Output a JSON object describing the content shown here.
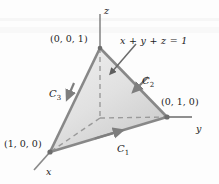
{
  "figure": {
    "type": "3d-diagram",
    "background_color": "#fdfdfd",
    "fill_colors": [
      "#e9e9e9",
      "#cfcfcf"
    ],
    "edge_color": "#8d8d8d",
    "axis_color": "#7d7d7d",
    "text_color": "#1c1c1c"
  },
  "axes": [
    {
      "name": "z",
      "label": "z",
      "label_x": 104,
      "label_y": 6
    },
    {
      "name": "y",
      "label": "y",
      "label_x": 196,
      "label_y": 124
    },
    {
      "name": "x",
      "label": "x",
      "label_x": 46,
      "label_y": 167
    }
  ],
  "vertices": [
    {
      "name": "z-intercept",
      "label": "(0, 0, 1)",
      "label_x": 50,
      "label_y": 34,
      "point_x": 100,
      "point_y": 48
    },
    {
      "name": "y-intercept",
      "label": "(0, 1, 0)",
      "label_x": 161,
      "label_y": 97,
      "point_x": 167,
      "point_y": 117
    },
    {
      "name": "x-intercept",
      "label": "(1, 0, 0)",
      "label_x": 4,
      "label_y": 139,
      "point_x": 50,
      "point_y": 152
    }
  ],
  "origin": {
    "x": 100,
    "y": 118
  },
  "plane": {
    "equation": "x + y + z = 1",
    "label_x": 120,
    "label_y": 36
  },
  "curves": [
    {
      "name": "C1",
      "label": "C",
      "subscript": "1",
      "label_x": 117,
      "label_y": 144,
      "direction": "from (1,0,0) to (0,1,0)"
    },
    {
      "name": "C2",
      "label": "C",
      "subscript": "2",
      "label_x": 142,
      "label_y": 76,
      "direction": "from (0,1,0) to (0,0,1)"
    },
    {
      "name": "C3",
      "label": "C",
      "subscript": "3",
      "label_x": 49,
      "label_y": 89,
      "direction": "from (0,0,1) to (1,0,0)"
    }
  ]
}
